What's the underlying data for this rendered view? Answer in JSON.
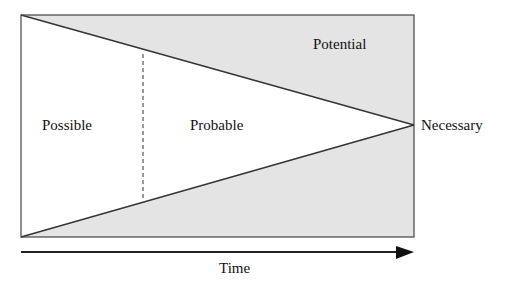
{
  "diagram": {
    "type": "futures-cone",
    "labels": {
      "possible": "Possible",
      "probable": "Probable",
      "potential": "Potential",
      "necessary": "Necessary",
      "time": "Time"
    },
    "colors": {
      "shaded_region": "#e4e4e4",
      "outline": "#333333",
      "background": "#ffffff"
    }
  }
}
